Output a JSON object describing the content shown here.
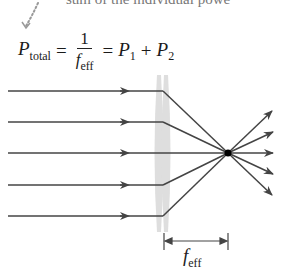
{
  "caption": {
    "top_text": "sum of the individual powe"
  },
  "equation": {
    "lhs_symbol": "P",
    "lhs_sub": "total",
    "equals1": "=",
    "frac_num": "1",
    "frac_den_symbol": "f",
    "frac_den_sub": "eff",
    "equals2": "=",
    "term1_symbol": "P",
    "term1_sub": "1",
    "plus": "+",
    "term2_symbol": "P",
    "term2_sub": "2"
  },
  "diagram": {
    "ray_color": "#444444",
    "lens_color": "#d6d6d6",
    "focal_point_color": "#000000",
    "incoming_rays_y": [
      91,
      122,
      153,
      185,
      216
    ],
    "lens_x": 163,
    "focal_point": {
      "x": 228,
      "y": 153
    },
    "focal_length_label_symbol": "f",
    "focal_length_label_sub": "eff"
  }
}
